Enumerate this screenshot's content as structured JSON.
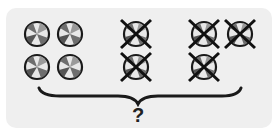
{
  "diagram": {
    "question_mark": "?",
    "groups": [
      {
        "name": "remaining-balls",
        "count": 4,
        "crossed": false
      },
      {
        "name": "crossed-balls-group-1",
        "count": 2,
        "crossed": true
      },
      {
        "name": "crossed-balls-group-2",
        "count": 3,
        "crossed": true
      }
    ],
    "colors": {
      "panel": "#efefef",
      "ink": "#1a1a1a",
      "ball_light": "#e6e6e6",
      "ball_dark": "#7a7a7a"
    }
  }
}
